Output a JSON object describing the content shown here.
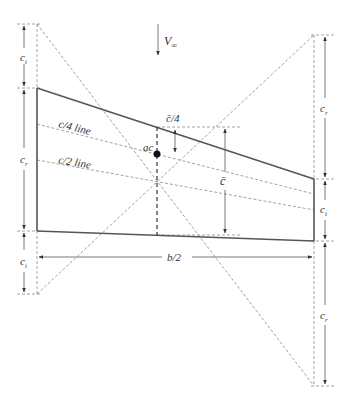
{
  "figure": {
    "type": "wing planform mean aerodynamic chord construction",
    "colors": {
      "outline": "#555555",
      "construction_lines": "#8a8a8a",
      "text": "#333333",
      "ac_point": "#111111"
    }
  },
  "labels": {
    "freestream": "V",
    "freestream_sub": "∞",
    "tip_chord_top_left": "c",
    "tip_chord_top_left_sub": "t",
    "root_chord_left": "c",
    "root_chord_left_sub": "r",
    "tip_chord_bottom_left": "c",
    "tip_chord_bottom_left_sub": "t",
    "root_chord_top_right": "c",
    "root_chord_top_right_sub": "r",
    "tip_chord_right": "c",
    "tip_chord_right_sub": "t",
    "root_chord_bottom_right": "c",
    "root_chord_bottom_right_sub": "r",
    "quarter_chord_line": "c/4 line",
    "half_chord_line": "c/2 line",
    "mac_quarter": "c̄/4",
    "aerodynamic_center": "ac",
    "mac": "c̄",
    "semispan": "b/2"
  }
}
